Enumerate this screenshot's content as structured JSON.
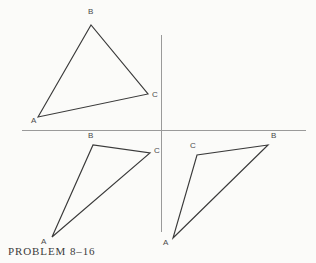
{
  "figure": {
    "caption": "PROBLEM 8–16",
    "background_color": "#fbfbf9",
    "line_color": "#3a3a3a",
    "axis_color": "#9a9a9a",
    "label_color": "#4a4a4a",
    "width": 316,
    "height": 263
  },
  "axes": {
    "horizontal": {
      "name": "horizontal-axis",
      "x1": 22,
      "y1": 130,
      "x2": 306,
      "y2": 130
    },
    "vertical": {
      "name": "vertical-axis",
      "x1": 161,
      "y1": 35,
      "x2": 161,
      "y2": 232
    }
  },
  "triangles": [
    {
      "id": "triangle-upper-left",
      "quadrant": "upper-left",
      "vertices": [
        {
          "label": "A",
          "x": 38,
          "y": 117,
          "label_x": 31,
          "label_y": 117
        },
        {
          "label": "B",
          "x": 91,
          "y": 25,
          "label_x": 88,
          "label_y": 8
        },
        {
          "label": "C",
          "x": 148,
          "y": 94,
          "label_x": 152,
          "label_y": 91
        }
      ]
    },
    {
      "id": "triangle-lower-left",
      "quadrant": "lower-left",
      "vertices": [
        {
          "label": "A",
          "x": 52,
          "y": 237,
          "label_x": 41,
          "label_y": 238
        },
        {
          "label": "B",
          "x": 93,
          "y": 145,
          "label_x": 88,
          "label_y": 132
        },
        {
          "label": "C",
          "x": 150,
          "y": 153,
          "label_x": 154,
          "label_y": 147
        }
      ]
    },
    {
      "id": "triangle-lower-right",
      "quadrant": "lower-right",
      "vertices": [
        {
          "label": "A",
          "x": 173,
          "y": 238,
          "label_x": 163,
          "label_y": 239
        },
        {
          "label": "B",
          "x": 268,
          "y": 145,
          "label_x": 271,
          "label_y": 132
        },
        {
          "label": "C",
          "x": 197,
          "y": 155,
          "label_x": 190,
          "label_y": 142
        }
      ]
    }
  ]
}
